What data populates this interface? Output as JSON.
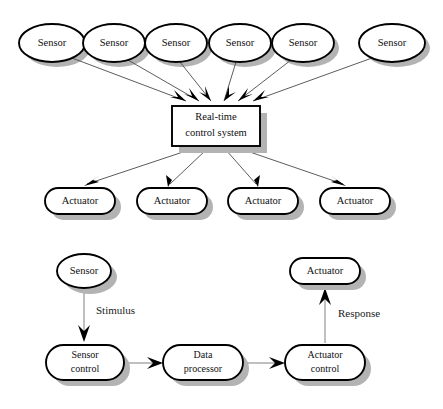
{
  "diagram": {
    "colors": {
      "background": "#ffffff",
      "node_fill": "#ffffff",
      "node_stroke": "#000000",
      "shadow": "#b3b3b3",
      "edge": "#4a4a4a",
      "text": "#101010"
    },
    "top": {
      "sensors": [
        {
          "label": "Sensor",
          "cx": 52,
          "cy": 43,
          "rx": 33,
          "ry": 19
        },
        {
          "label": "Sensor",
          "cx": 114,
          "cy": 43,
          "rx": 31,
          "ry": 19
        },
        {
          "label": "Sensor",
          "cx": 176,
          "cy": 43,
          "rx": 31,
          "ry": 19
        },
        {
          "label": "Sensor",
          "cx": 240,
          "cy": 43,
          "rx": 31,
          "ry": 19
        },
        {
          "label": "Sensor",
          "cx": 303,
          "cy": 43,
          "rx": 31,
          "ry": 19
        },
        {
          "label": "Sensor",
          "cx": 392,
          "cy": 43,
          "rx": 33,
          "ry": 19
        }
      ],
      "controller": {
        "label_line1": "Real-time",
        "label_line2": "control system",
        "x": 172,
        "y": 106,
        "width": 88,
        "height": 40
      },
      "actuators": [
        {
          "label": "Actuator",
          "x": 45,
          "y": 188,
          "width": 70,
          "height": 26
        },
        {
          "label": "Actuator",
          "x": 137,
          "y": 188,
          "width": 70,
          "height": 26
        },
        {
          "label": "Actuator",
          "x": 228,
          "y": 188,
          "width": 70,
          "height": 26
        },
        {
          "label": "Actuator",
          "x": 320,
          "y": 188,
          "width": 70,
          "height": 26
        }
      ]
    },
    "bottom": {
      "sensor": {
        "label": "Sensor",
        "cx": 84,
        "cy": 271,
        "rx": 27,
        "ry": 17
      },
      "actuator": {
        "label": "Actuator",
        "x": 290,
        "y": 258,
        "width": 70,
        "height": 26
      },
      "sensor_control": {
        "label_line1": "Sensor",
        "label_line2": "control",
        "x": 46,
        "y": 345,
        "width": 78,
        "height": 35
      },
      "data_processor": {
        "label_line1": "Data",
        "label_line2": "processor",
        "x": 163,
        "y": 345,
        "width": 80,
        "height": 35
      },
      "actuator_control": {
        "label_line1": "Actuator",
        "label_line2": "control",
        "x": 285,
        "y": 345,
        "width": 80,
        "height": 35
      },
      "edge_labels": {
        "stimulus": "Stimulus",
        "response": "Response"
      }
    }
  }
}
